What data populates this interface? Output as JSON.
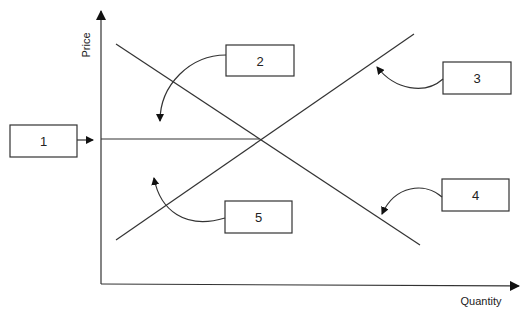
{
  "diagram": {
    "type": "supply-demand",
    "axes": {
      "y_label": "Price",
      "x_label": "Quantity"
    },
    "curves": [
      {
        "name": "demand",
        "direction": "downward-sloping"
      },
      {
        "name": "supply",
        "direction": "upward-sloping"
      }
    ],
    "equilibrium_price_line": true,
    "callout_boxes": [
      {
        "id": "1",
        "label": "1",
        "points_to": "equilibrium price line on price axis"
      },
      {
        "id": "2",
        "label": "2",
        "points_to": "region above equilibrium price"
      },
      {
        "id": "3",
        "label": "3",
        "points_to": "supply curve"
      },
      {
        "id": "4",
        "label": "4",
        "points_to": "demand curve"
      },
      {
        "id": "5",
        "label": "5",
        "points_to": "region below equilibrium price"
      }
    ]
  }
}
